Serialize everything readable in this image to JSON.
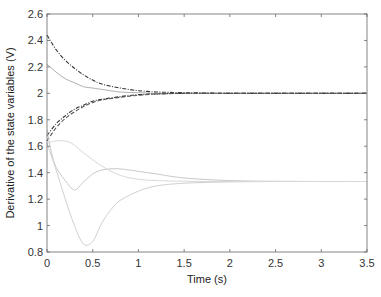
{
  "chart_data": {
    "type": "line",
    "title": "",
    "xlabel": "Time (s)",
    "ylabel": "Derivative of the state variables (V)",
    "xlim": [
      0,
      3.5
    ],
    "ylim": [
      0.8,
      2.6
    ],
    "xticks": [
      0,
      0.5,
      1,
      1.5,
      2,
      2.5,
      3,
      3.5
    ],
    "xtick_labels": [
      "0",
      "0.5",
      "1",
      "1.5",
      "2",
      "2.5",
      "3",
      "3.5"
    ],
    "yticks": [
      0.8,
      1,
      1.2,
      1.4,
      1.6,
      1.8,
      2,
      2.2,
      2.4,
      2.6
    ],
    "ytick_labels": [
      "0.8",
      "1",
      "1.2",
      "1.4",
      "1.6",
      "1.8",
      "2",
      "2.2",
      "2.4",
      "2.6"
    ],
    "grid": false,
    "legend": null,
    "series": [
      {
        "name": "state-1",
        "style": "dashdot",
        "color": "#333333",
        "x": [
          0,
          0.1,
          0.2,
          0.3,
          0.4,
          0.5,
          0.6,
          0.8,
          1.0,
          1.2,
          1.5,
          2.0,
          2.5,
          3.0,
          3.5
        ],
        "y": [
          2.44,
          2.33,
          2.25,
          2.19,
          2.14,
          2.1,
          2.07,
          2.04,
          2.02,
          2.01,
          2.005,
          2.0,
          2.0,
          2.0,
          2.0
        ]
      },
      {
        "name": "state-2",
        "style": "solid",
        "color": "#b0b0b0",
        "x": [
          0,
          0.1,
          0.2,
          0.3,
          0.4,
          0.5,
          0.6,
          0.8,
          1.0,
          1.2,
          1.5,
          2.0,
          2.5,
          3.0,
          3.5
        ],
        "y": [
          2.22,
          2.16,
          2.11,
          2.08,
          2.05,
          2.04,
          2.03,
          2.01,
          2.005,
          2.0,
          2.0,
          2.0,
          2.0,
          2.0,
          2.0
        ]
      },
      {
        "name": "state-3",
        "style": "dashdot",
        "color": "#333333",
        "x": [
          0,
          0.1,
          0.2,
          0.3,
          0.4,
          0.5,
          0.6,
          0.8,
          1.0,
          1.2,
          1.5,
          2.0,
          2.5,
          3.0,
          3.5
        ],
        "y": [
          1.68,
          1.77,
          1.83,
          1.88,
          1.91,
          1.94,
          1.955,
          1.975,
          1.99,
          1.995,
          2.0,
          2.0,
          2.0,
          2.0,
          2.0
        ]
      },
      {
        "name": "state-4",
        "style": "dashed",
        "color": "#555555",
        "x": [
          0,
          0.1,
          0.2,
          0.3,
          0.4,
          0.5,
          0.6,
          0.8,
          1.0,
          1.2,
          1.5,
          2.0,
          2.5,
          3.0,
          3.5
        ],
        "y": [
          1.64,
          1.74,
          1.81,
          1.86,
          1.9,
          1.93,
          1.95,
          1.97,
          1.985,
          1.995,
          2.0,
          2.0,
          2.0,
          2.0,
          2.0
        ]
      },
      {
        "name": "state-5",
        "style": "solid",
        "color": "#c8c8c8",
        "x": [
          0,
          0.05,
          0.1,
          0.2,
          0.3,
          0.4,
          0.5,
          0.6,
          0.75,
          0.9,
          1.0,
          1.2,
          1.5,
          2.0,
          2.5,
          3.0,
          3.5
        ],
        "y": [
          1.72,
          1.55,
          1.44,
          1.34,
          1.27,
          1.33,
          1.39,
          1.42,
          1.43,
          1.42,
          1.41,
          1.39,
          1.36,
          1.34,
          1.335,
          1.333,
          1.333
        ]
      },
      {
        "name": "state-6",
        "style": "solid",
        "color": "#d0d0d0",
        "x": [
          0,
          0.1,
          0.2,
          0.3,
          0.4,
          0.5,
          0.6,
          0.7,
          0.8,
          1.0,
          1.2,
          1.5,
          2.0,
          2.5,
          3.0,
          3.5
        ],
        "y": [
          1.62,
          1.42,
          1.2,
          1.0,
          0.86,
          0.88,
          1.02,
          1.12,
          1.19,
          1.26,
          1.3,
          1.32,
          1.33,
          1.333,
          1.333,
          1.333
        ]
      },
      {
        "name": "state-7",
        "style": "solid",
        "color": "#d8d8d8",
        "x": [
          0,
          0.1,
          0.25,
          0.4,
          0.6,
          0.8,
          1.0,
          1.2,
          1.5,
          2.0,
          2.5,
          3.0,
          3.5
        ],
        "y": [
          1.62,
          1.64,
          1.63,
          1.55,
          1.45,
          1.38,
          1.35,
          1.34,
          1.335,
          1.333,
          1.333,
          1.333,
          1.333
        ]
      }
    ]
  },
  "plot_area": {
    "left": 47,
    "top": 14,
    "right": 367,
    "bottom": 252
  },
  "colors": {
    "axis": "#555555",
    "tick_text": "#333333",
    "background": "#ffffff"
  }
}
